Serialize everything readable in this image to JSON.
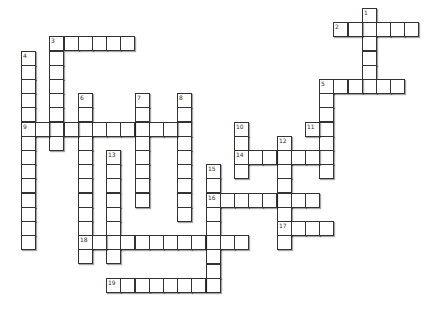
{
  "puzzle": {
    "type": "crossword",
    "cell_size": 14.2,
    "origin": {
      "x": 21,
      "y": 8
    },
    "colors": {
      "cell_border": "#333333",
      "cell_fill": "#ffffff",
      "background": "#ffffff"
    },
    "entries": [
      {
        "number": "1",
        "direction": "down",
        "row": 0,
        "col": 24,
        "length": 6
      },
      {
        "number": "2",
        "direction": "across",
        "row": 1,
        "col": 22,
        "length": 6
      },
      {
        "number": "3",
        "direction": "across",
        "row": 2,
        "col": 2,
        "length": 6
      },
      {
        "number": "3",
        "direction": "down",
        "row": 2,
        "col": 2,
        "length": 8
      },
      {
        "number": "4",
        "direction": "down",
        "row": 3,
        "col": 0,
        "length": 14
      },
      {
        "number": "5",
        "direction": "across",
        "row": 5,
        "col": 21,
        "length": 6
      },
      {
        "number": "5",
        "direction": "down",
        "row": 5,
        "col": 21,
        "length": 7
      },
      {
        "number": "6",
        "direction": "down",
        "row": 6,
        "col": 4,
        "length": 12
      },
      {
        "number": "7",
        "direction": "down",
        "row": 6,
        "col": 8,
        "length": 8
      },
      {
        "number": "8",
        "direction": "down",
        "row": 6,
        "col": 11,
        "length": 9
      },
      {
        "number": "9",
        "direction": "across",
        "row": 8,
        "col": 0,
        "length": 12
      },
      {
        "number": "10",
        "direction": "down",
        "row": 8,
        "col": 15,
        "length": 4
      },
      {
        "number": "11",
        "direction": "across",
        "row": 8,
        "col": 20,
        "length": 2
      },
      {
        "number": "12",
        "direction": "down",
        "row": 9,
        "col": 18,
        "length": 8
      },
      {
        "number": "13",
        "direction": "down",
        "row": 10,
        "col": 6,
        "length": 8
      },
      {
        "number": "14",
        "direction": "across",
        "row": 10,
        "col": 15,
        "length": 7
      },
      {
        "number": "15",
        "direction": "down",
        "row": 11,
        "col": 13,
        "length": 9
      },
      {
        "number": "16",
        "direction": "across",
        "row": 13,
        "col": 13,
        "length": 8
      },
      {
        "number": "17",
        "direction": "across",
        "row": 15,
        "col": 18,
        "length": 4
      },
      {
        "number": "18",
        "direction": "across",
        "row": 16,
        "col": 4,
        "length": 12
      },
      {
        "number": "19",
        "direction": "across",
        "row": 19,
        "col": 6,
        "length": 8
      }
    ]
  }
}
